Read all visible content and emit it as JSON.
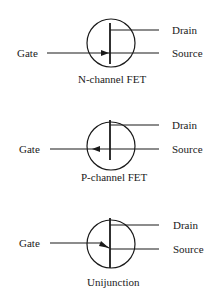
{
  "diagram": {
    "symbols": [
      {
        "name": "N-channel FET",
        "caption": "N-channel FET",
        "terminals": {
          "gate": "Gate",
          "drain": "Drain",
          "source": "Source"
        },
        "arrow_direction": "inward"
      },
      {
        "name": "P-channel FET",
        "caption": "P-channel FET",
        "terminals": {
          "gate": "Gate",
          "drain": "Drain",
          "source": "Source"
        },
        "arrow_direction": "outward"
      },
      {
        "name": "Unijunction",
        "caption": "Unijunction",
        "terminals": {
          "gate": "Gate",
          "drain": "Drain",
          "source": "Source"
        },
        "arrow_direction": "angled-inward"
      }
    ],
    "stroke_color": "#1a1a1a",
    "background_color": "#ffffff"
  }
}
